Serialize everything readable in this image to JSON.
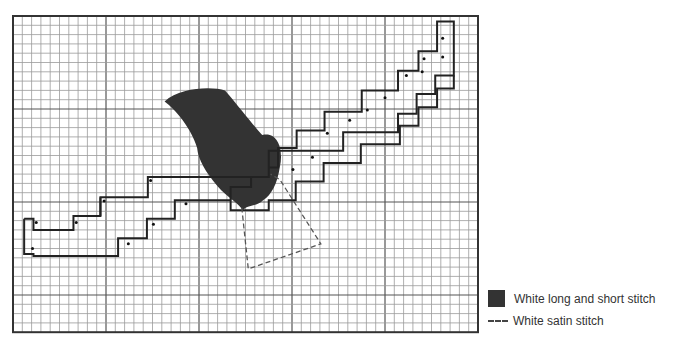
{
  "grid": {
    "left": 13,
    "top": 16,
    "cell": 9.3,
    "cols": 50,
    "rows": 34,
    "major_every": 10,
    "minor_color": "#9a9a9a",
    "major_color": "#555555",
    "border_color": "#333333"
  },
  "stitch_color": "#222222",
  "fill_color": "#333333",
  "legend": {
    "long_short_label": "White long and short stitch",
    "satin_label": "White satin stitch"
  },
  "outline_paths": [
    [
      [
        1.2,
        21.8
      ],
      [
        2.2,
        21.8
      ],
      [
        2.2,
        23.0
      ],
      [
        6.5,
        23.0
      ],
      [
        6.5,
        21.5
      ],
      [
        9.4,
        21.5
      ],
      [
        9.4,
        19.5
      ],
      [
        14.5,
        19.5
      ],
      [
        14.5,
        17.3
      ],
      [
        27.5,
        17.3
      ],
      [
        27.5,
        14.5
      ],
      [
        35.5,
        14.5
      ],
      [
        35.5,
        12.5
      ],
      [
        41.4,
        12.5
      ],
      [
        41.4,
        10.5
      ],
      [
        43.4,
        10.5
      ],
      [
        43.4,
        8.4
      ],
      [
        45.4,
        8.4
      ],
      [
        45.4,
        6.4
      ],
      [
        47.4,
        6.4
      ],
      [
        47.4,
        0.6
      ],
      [
        45.6,
        0.6
      ],
      [
        45.6,
        3.8
      ],
      [
        43.6,
        3.8
      ],
      [
        43.6,
        5.9
      ],
      [
        41.4,
        5.9
      ],
      [
        41.4,
        8.0
      ],
      [
        37.5,
        8.0
      ],
      [
        37.5,
        10.3
      ],
      [
        33.5,
        10.3
      ],
      [
        33.5,
        12.3
      ],
      [
        30.5,
        12.3
      ],
      [
        30.5,
        14.2
      ],
      [
        28.5,
        14.2
      ],
      [
        28.5,
        16.3
      ],
      [
        27.5,
        16.3
      ],
      [
        27.5,
        17.3
      ]
    ],
    [
      [
        1.2,
        21.8
      ],
      [
        1.2,
        25.6
      ],
      [
        2.2,
        25.6
      ],
      [
        2.2,
        25.8
      ],
      [
        11.3,
        25.8
      ],
      [
        11.3,
        23.9
      ],
      [
        14.4,
        23.9
      ],
      [
        14.4,
        21.8
      ],
      [
        17.4,
        21.8
      ],
      [
        17.4,
        19.8
      ],
      [
        23.4,
        19.8
      ],
      [
        23.4,
        20.9
      ],
      [
        27.5,
        20.9
      ],
      [
        27.5,
        19.8
      ],
      [
        30.4,
        19.8
      ],
      [
        30.4,
        17.8
      ],
      [
        33.4,
        17.8
      ],
      [
        33.4,
        15.8
      ],
      [
        37.4,
        15.8
      ],
      [
        37.4,
        13.8
      ],
      [
        41.6,
        13.8
      ],
      [
        41.6,
        11.8
      ],
      [
        43.6,
        11.8
      ],
      [
        43.6,
        9.8
      ],
      [
        45.6,
        9.8
      ],
      [
        45.6,
        7.8
      ],
      [
        47.4,
        7.8
      ],
      [
        47.4,
        6.4
      ]
    ],
    [
      [
        9.4,
        19.5
      ],
      [
        9.4,
        21.5
      ]
    ],
    [
      [
        23.4,
        19.8
      ],
      [
        23.4,
        18.4
      ],
      [
        25.6,
        18.4
      ],
      [
        25.6,
        17.3
      ]
    ]
  ],
  "dots": [
    [
      2.5,
      22.2
    ],
    [
      6.8,
      22.2
    ],
    [
      9.8,
      19.9
    ],
    [
      14.8,
      17.7
    ],
    [
      2.1,
      25.0
    ],
    [
      12.4,
      24.5
    ],
    [
      15.1,
      22.4
    ],
    [
      18.6,
      20.2
    ],
    [
      30.1,
      16.5
    ],
    [
      32.2,
      15.2
    ],
    [
      33.8,
      12.6
    ],
    [
      36.2,
      11.2
    ],
    [
      38.1,
      10.1
    ],
    [
      40.0,
      8.8
    ],
    [
      42.3,
      6.4
    ],
    [
      44.0,
      6.0
    ],
    [
      44.2,
      4.6
    ],
    [
      46.2,
      4.4
    ],
    [
      46.2,
      2.4
    ]
  ],
  "satin_path": [
    [
      24.6,
      20.6
    ],
    [
      25.3,
      27.2
    ],
    [
      33.1,
      24.5
    ],
    [
      28.7,
      17.6
    ],
    [
      27.7,
      17.0
    ]
  ],
  "shape_path": "M 16.3 9.2 C 18.0 7.6 21.5 7.6 22.8 8.0 C 24.5 10.0 25.9 11.8 26.8 12.8 C 28.5 12.4 29.1 14.4 28.7 16.2 C 28.4 18.1 27.8 19.2 26.9 19.8 C 26.0 20.6 25.3 20.2 24.7 20.9 C 24.4 20.2 23.0 19.5 22.0 18.3 C 20.7 16.8 19.9 15.4 19.8 14.2 C 19.2 12.1 17.5 10.1 16.3 9.2 Z"
}
